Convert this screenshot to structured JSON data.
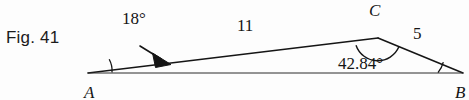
{
  "figure": {
    "caption": "Fig. 41",
    "type": "triangle-diagram",
    "ink_color": "#151515",
    "background_color": "#fdfdfd",
    "vertices": [
      {
        "name": "A",
        "label": "A",
        "x": 88,
        "y": 73
      },
      {
        "name": "B",
        "label": "B",
        "x": 463,
        "y": 73
      },
      {
        "name": "C",
        "label": "C",
        "x": 378,
        "y": 38
      }
    ],
    "sides": [
      {
        "name": "side-AC",
        "label": "11",
        "from": "A",
        "to": "C"
      },
      {
        "name": "side-CB",
        "label": "5",
        "from": "C",
        "to": "B"
      },
      {
        "name": "side-AB",
        "label": "",
        "from": "A",
        "to": "B"
      }
    ],
    "angles": [
      {
        "name": "angle-A",
        "label": "18°",
        "vertex": "A",
        "has_leader_arrow": true
      },
      {
        "name": "angle-B",
        "label": "42.84°",
        "vertex": "B",
        "has_leader_arrow": false
      },
      {
        "name": "angle-C",
        "label": "",
        "vertex": "C",
        "has_leader_arrow": false
      }
    ],
    "geometry_paths": {
      "line_AC": "M88,73 L378,38",
      "line_CB": "M378,38 L463,73",
      "line_AB": "M88,73 L463,73",
      "arc_A": "M110,72.3 A22,22 0 0 0 105.8,59.6",
      "arc_B": "M440,73 A23,23 0 0 0 444.2,63.6",
      "arc_C": "M356.5,44.5 A22,22 0 0 0 398.5,45.5",
      "leader_line": "M141,47 L163,60",
      "arrowhead": "M170,63.5 L155,54.5 L157,66.5 Z"
    }
  }
}
